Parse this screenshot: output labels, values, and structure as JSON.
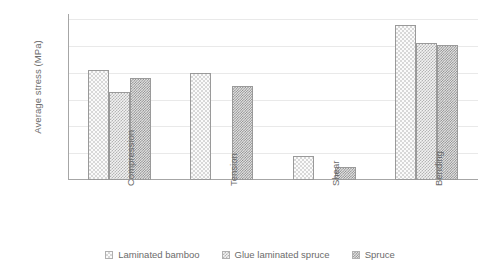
{
  "chart_data": {
    "type": "bar",
    "title": "",
    "xlabel": "",
    "ylabel": "Average stress (MPa)",
    "categories": [
      "Compression",
      "Tension",
      "Shear",
      "Bending"
    ],
    "series": [
      {
        "name": "Laminated bamboo",
        "pattern": "light",
        "values": [
          41,
          40,
          9,
          58
        ]
      },
      {
        "name": "Glue laminated spruce",
        "pattern": "medium",
        "values": [
          33,
          null,
          null,
          51
        ]
      },
      {
        "name": "Spruce",
        "pattern": "dark",
        "values": [
          38,
          35,
          5,
          50.5
        ]
      }
    ],
    "ylim": [
      0,
      62
    ],
    "yticks": [
      10,
      20,
      30,
      40,
      50,
      60
    ],
    "ytick_labels": [
      "10",
      "20",
      "30",
      "40",
      "50",
      "60"
    ],
    "grid": true,
    "legend_position": "bottom",
    "colors": {
      "gridline": "#e9e9e9",
      "axis": "#a6a6a6",
      "text": "#6b6b6b",
      "bar_outline": "#9a9a9a",
      "background": "#ffffff"
    }
  },
  "axis": {
    "y_title": "Average stress (MPa)"
  },
  "legend": {
    "items": [
      {
        "label": "Laminated bamboo"
      },
      {
        "label": "Glue laminated spruce"
      },
      {
        "label": "Spruce"
      }
    ]
  }
}
